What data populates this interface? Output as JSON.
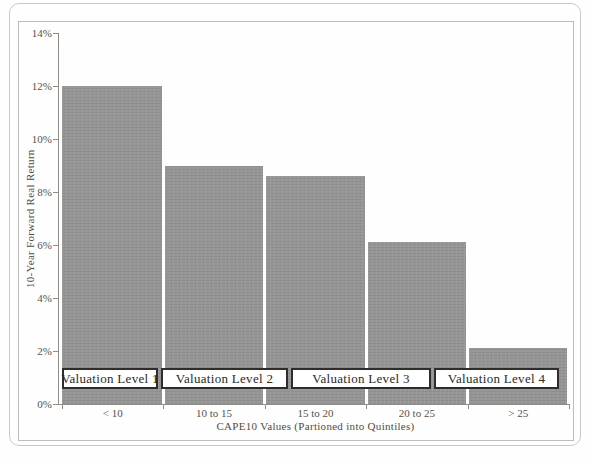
{
  "chart_data": {
    "type": "bar",
    "title": "",
    "categories": [
      "< 10",
      "10 to 15",
      "15 to 20",
      "20 to 25",
      "> 25"
    ],
    "values": [
      12,
      9,
      8.6,
      6.1,
      2.1
    ],
    "unit": "%",
    "xlabel": "CAPE10 Values (Partioned into Quintiles)",
    "ylabel": "10-Year Forward Real Return",
    "ylim": [
      0,
      14
    ],
    "ytick_step": 2,
    "ytick_labels": [
      "0%",
      "2%",
      "4%",
      "6%",
      "8%",
      "10%",
      "12%",
      "14%"
    ],
    "grid": false,
    "legend": false,
    "bar_color": "#969696",
    "annotation_boxes": [
      {
        "label": "Valuation Level 1"
      },
      {
        "label": "Valuation Level 2"
      },
      {
        "label": "Valuation Level 3"
      },
      {
        "label": "Valuation Level 4"
      }
    ]
  },
  "colors": {
    "bar": "#969696",
    "frame_border": "#bcbcba",
    "outer_border": "#c9c9c7",
    "axis": "#8f8d88",
    "text": "#504d44",
    "box_border": "#2e2d2a",
    "box_fill": "#ffffff"
  }
}
